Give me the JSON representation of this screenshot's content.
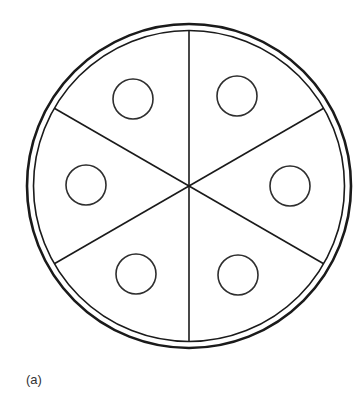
{
  "figure": {
    "caption": "(a)",
    "stroke_color": "#1a1a1a",
    "small_circle_color": "#2e2e2e",
    "background": "#ffffff",
    "center": {
      "x": 189,
      "y": 186
    },
    "outer_ring": {
      "radius": 162,
      "stroke_width": 2.6
    },
    "inner_ring": {
      "radius": 155.5,
      "stroke_width": 1.6
    },
    "divider_lines": [
      {
        "angle_deg": 90,
        "label": "vertical-diameter"
      },
      {
        "angle_deg": 30,
        "label": "diameter-30deg"
      },
      {
        "angle_deg": 150,
        "label": "diameter-150deg"
      }
    ],
    "sector_count": 6,
    "small_circles": [
      {
        "sector": "top-left",
        "cx": 133,
        "cy": 99,
        "r": 20
      },
      {
        "sector": "top-right",
        "cx": 237,
        "cy": 96,
        "r": 20
      },
      {
        "sector": "left",
        "cx": 86,
        "cy": 185,
        "r": 20
      },
      {
        "sector": "right",
        "cx": 290,
        "cy": 186,
        "r": 20
      },
      {
        "sector": "bottom-left",
        "cx": 136,
        "cy": 274,
        "r": 20
      },
      {
        "sector": "bottom-right",
        "cx": 238,
        "cy": 275,
        "r": 20
      }
    ]
  }
}
